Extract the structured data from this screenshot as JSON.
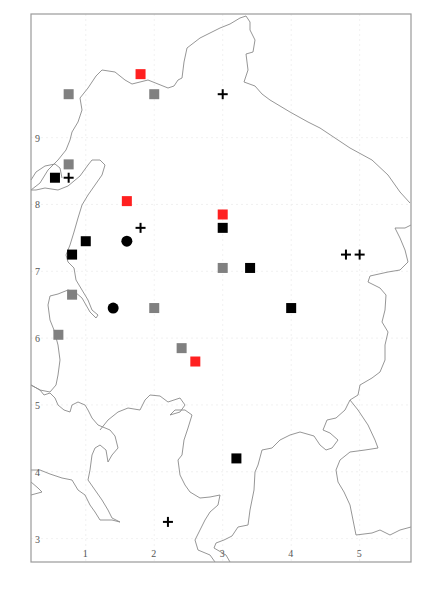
{
  "chart_data": {
    "type": "scatter",
    "title": "",
    "xlabel": "",
    "ylabel": "",
    "xlim": [
      0.2,
      5.75
    ],
    "ylim": [
      2.65,
      10.85
    ],
    "grid": true,
    "x_ticks": [
      "1",
      "2",
      "3",
      "4",
      "5"
    ],
    "y_ticks": [
      "3",
      "4",
      "5",
      "6",
      "7",
      "8",
      "9"
    ],
    "legend": null,
    "colors": {
      "black_square": "#000000",
      "gray_square": "#808080",
      "red_square": "#ff2020",
      "circle": "#000000",
      "plus": "#000000"
    },
    "series": [
      {
        "name": "black_square",
        "marker": "square",
        "points": [
          [
            0.55,
            8.4
          ],
          [
            1.0,
            7.45
          ],
          [
            0.8,
            7.25
          ],
          [
            3.0,
            7.65
          ],
          [
            3.4,
            7.05
          ],
          [
            4.0,
            6.45
          ],
          [
            3.2,
            4.2
          ]
        ]
      },
      {
        "name": "gray_square",
        "marker": "square",
        "points": [
          [
            0.75,
            9.65
          ],
          [
            2.0,
            9.65
          ],
          [
            0.75,
            8.6
          ],
          [
            3.0,
            7.05
          ],
          [
            0.8,
            6.65
          ],
          [
            2.0,
            6.45
          ],
          [
            0.6,
            6.05
          ],
          [
            2.4,
            5.85
          ]
        ]
      },
      {
        "name": "red_square",
        "marker": "square",
        "points": [
          [
            1.8,
            9.95
          ],
          [
            1.6,
            8.05
          ],
          [
            3.0,
            7.85
          ],
          [
            2.6,
            5.65
          ]
        ]
      },
      {
        "name": "circle",
        "marker": "circle",
        "points": [
          [
            1.6,
            7.45
          ],
          [
            1.4,
            6.45
          ]
        ]
      },
      {
        "name": "plus",
        "marker": "plus",
        "points": [
          [
            3.0,
            9.65
          ],
          [
            0.75,
            8.4
          ],
          [
            1.8,
            7.65
          ],
          [
            4.8,
            7.25
          ],
          [
            5.0,
            7.25
          ],
          [
            2.2,
            3.25
          ]
        ]
      }
    ]
  }
}
